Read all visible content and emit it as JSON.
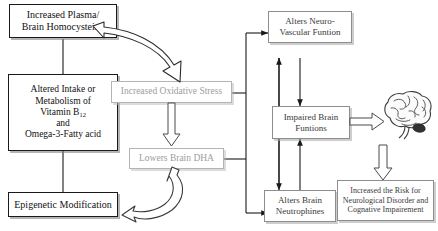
{
  "diagram": {
    "colors": {
      "dark_border": "#1a1a1a",
      "gray_border": "#b4b4b4",
      "gray_text": "#9d9d9d",
      "mid_border": "#8d8d8d",
      "background": "#ffffff",
      "connector": "#1a1a1a"
    },
    "nodes": {
      "homocysteine": "Increased Plasma/\nBrain Homocysteine",
      "intake_line1": "Altered Intake or",
      "intake_line2": "Metabolism of",
      "intake_line3_a": "Vitamin B",
      "intake_line3_sub": "12",
      "intake_line4": "and",
      "intake_line5": "Omega-3-Fatty acid",
      "epigenetic": "Epigenetic Modification",
      "oxidative_stress": "Increased Oxidative Stress",
      "lowers_dha": "Lowers Brain DHA",
      "neurovascular": "Alters Neuro-\nVascular Funtion",
      "impaired_brain": "Impaired Brain\nFuntions",
      "neutrophines": "Alters Brain\nNeutrophines",
      "risk": "Increased the Risk for\nNeurological Disorder and\nCognative Impairement"
    },
    "icons": {
      "brain": "brain-illustration"
    }
  }
}
